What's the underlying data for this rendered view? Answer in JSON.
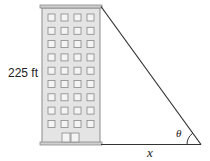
{
  "diagram": {
    "height_label": "225 ft",
    "base_label": "x",
    "angle_label": "θ",
    "building": {
      "window_columns": 4,
      "window_rows": 9,
      "fill": "#e4e4e4",
      "stroke": "#888888"
    },
    "line_color": "#333333"
  }
}
